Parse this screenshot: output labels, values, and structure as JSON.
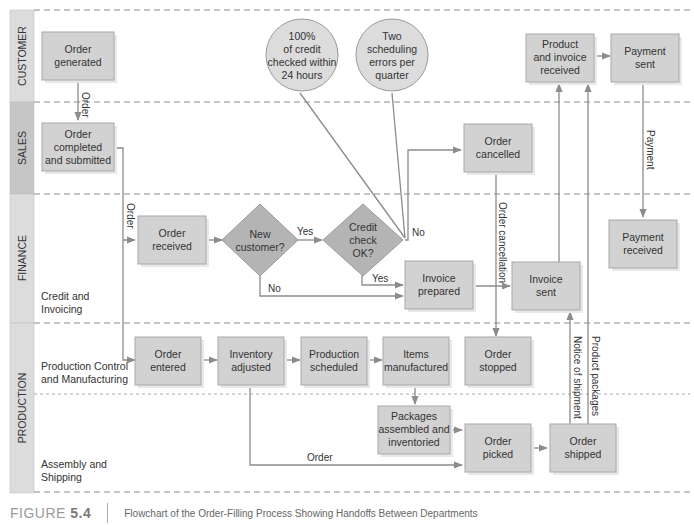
{
  "lanes": [
    {
      "id": "customer",
      "label": "CUSTOMER"
    },
    {
      "id": "sales",
      "label": "SALES"
    },
    {
      "id": "finance",
      "label": "FINANCE",
      "sublabels": [
        "Credit and",
        "Invoicing"
      ]
    },
    {
      "id": "production",
      "label": "PRODUCTION",
      "sublabels": [
        "Production Control",
        "and Manufacturing"
      ],
      "sublabels2": [
        "Assembly and",
        "Shipping"
      ]
    }
  ],
  "nodes": {
    "order_generated": [
      "Order",
      "generated"
    ],
    "order_completed": [
      "Order",
      "completed",
      "and submitted"
    ],
    "order_received": [
      "Order",
      "received"
    ],
    "new_customer": [
      "New",
      "customer?"
    ],
    "credit_check": [
      "Credit",
      "check",
      "OK?"
    ],
    "order_cancelled": [
      "Order",
      "cancelled"
    ],
    "invoice_prepared": [
      "Invoice",
      "prepared"
    ],
    "invoice_sent": [
      "Invoice",
      "sent"
    ],
    "product_invoice_received": [
      "Product",
      "and invoice",
      "received"
    ],
    "payment_sent": [
      "Payment",
      "sent"
    ],
    "payment_received": [
      "Payment",
      "received"
    ],
    "order_entered": [
      "Order",
      "entered"
    ],
    "inventory_adjusted": [
      "Inventory",
      "adjusted"
    ],
    "production_scheduled": [
      "Production",
      "scheduled"
    ],
    "items_manufactured": [
      "Items",
      "manufactured"
    ],
    "order_stopped": [
      "Order",
      "stopped"
    ],
    "packages_assembled": [
      "Packages",
      "assembled and",
      "inventoried"
    ],
    "order_picked": [
      "Order",
      "picked"
    ],
    "order_shipped": [
      "Order",
      "shipped"
    ]
  },
  "metrics": {
    "credit_metric": [
      "100%",
      "of credit",
      "checked within",
      "24 hours"
    ],
    "scheduling_metric": [
      "Two",
      "scheduling",
      "errors per",
      "quarter"
    ]
  },
  "edge_labels": {
    "order1": "Order",
    "order2": "Order",
    "yes1": "Yes",
    "no1": "No",
    "yes2": "Yes",
    "no2": "No",
    "order_cancellation": "Order cancellation",
    "payment": "Payment",
    "notice_of_shipment": "Notice of shipment",
    "product_packages": "Product packages",
    "order3": "Order"
  },
  "caption": {
    "figure_word": "FIGURE ",
    "figure_num": "5.4",
    "text": "Flowchart of the Order-Filling Process Showing Handoffs Between Departments"
  }
}
